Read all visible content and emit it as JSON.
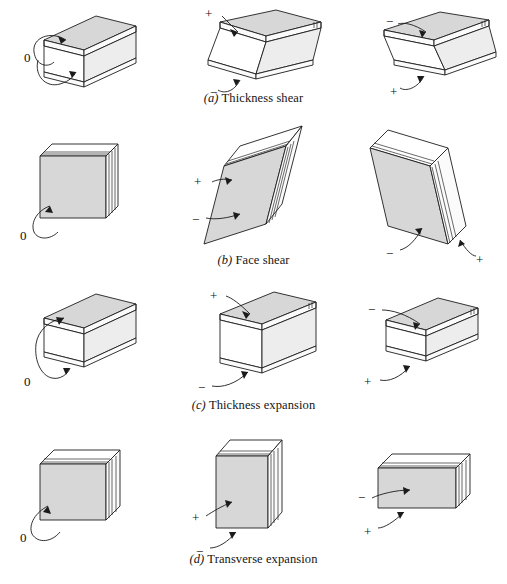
{
  "figure": {
    "background": "#ffffff",
    "shade_color": "#d7d7d7",
    "line_color": "#1d1d1d",
    "columns": 3,
    "rows": 4
  },
  "rows": [
    {
      "id": "a",
      "caption_index": "(a)",
      "caption_text": "Thickness shear",
      "caption_full": "(a) Thickness shear",
      "panels": [
        {
          "state": "neutral",
          "sign_labels": [
            "0"
          ],
          "shape": "flat-plate-undeformed"
        },
        {
          "state": "positive",
          "sign_labels": [
            "+",
            "−"
          ],
          "shape": "flat-plate-sheared-right"
        },
        {
          "state": "negative",
          "sign_labels": [
            "−",
            "+"
          ],
          "shape": "flat-plate-sheared-left"
        }
      ]
    },
    {
      "id": "b",
      "caption_index": "(b)",
      "caption_text": "Face shear",
      "caption_full": "(b) Face shear",
      "panels": [
        {
          "state": "neutral",
          "sign_labels": [
            "0"
          ],
          "shape": "upright-slab-undeformed"
        },
        {
          "state": "positive",
          "sign_labels": [
            "+",
            "−"
          ],
          "shape": "upright-slab-skew-left"
        },
        {
          "state": "negative",
          "sign_labels": [
            "−",
            "+"
          ],
          "shape": "upright-slab-skew-right"
        }
      ]
    },
    {
      "id": "c",
      "caption_index": "(c)",
      "caption_text": "Thickness expansion",
      "caption_full": "(c) Thickness expansion",
      "panels": [
        {
          "state": "neutral",
          "sign_labels": [
            "0"
          ],
          "shape": "block-nominal-thickness"
        },
        {
          "state": "positive",
          "sign_labels": [
            "+",
            "−"
          ],
          "shape": "block-thicker"
        },
        {
          "state": "negative",
          "sign_labels": [
            "−",
            "+"
          ],
          "shape": "block-thinner"
        }
      ]
    },
    {
      "id": "d",
      "caption_index": "(d)",
      "caption_text": "Transverse expansion",
      "caption_full": "(d) Transverse expansion",
      "panels": [
        {
          "state": "neutral",
          "sign_labels": [
            "0"
          ],
          "shape": "slab-nominal-height"
        },
        {
          "state": "positive",
          "sign_labels": [
            "+",
            "−"
          ],
          "shape": "slab-taller-narrower"
        },
        {
          "state": "negative",
          "sign_labels": [
            "−",
            "+"
          ],
          "shape": "slab-shorter-wider"
        }
      ]
    }
  ],
  "signs": {
    "zero": "0",
    "plus": "+",
    "minus": "−"
  }
}
